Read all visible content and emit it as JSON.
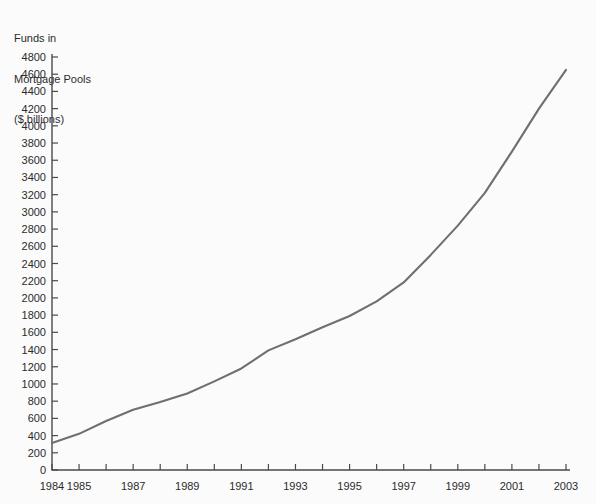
{
  "title": {
    "line1": "Funds in",
    "line2": "Mortgage Pools",
    "line3": "($ billions)"
  },
  "colors": {
    "line": "#6f6f6f",
    "axis": "#4a4a4a",
    "text": "#2b2b2b",
    "background": "#fbfbfb"
  },
  "chart_data": {
    "type": "line",
    "title": "Funds in Mortgage Pools ($ billions)",
    "xlabel": "",
    "ylabel": "Funds in Mortgage Pools ($ billions)",
    "ylim": [
      0,
      4800
    ],
    "xlim": [
      1984,
      2003
    ],
    "grid": false,
    "legend": "none",
    "ytick_labels": [
      "0",
      "200",
      "400",
      "600",
      "800",
      "1000",
      "1200",
      "1400",
      "1600",
      "1800",
      "2000",
      "2200",
      "2400",
      "2600",
      "2800",
      "3000",
      "3200",
      "3400",
      "3600",
      "3800",
      "4000",
      "4200",
      "4400",
      "4600",
      "4800"
    ],
    "ytick_values": [
      0,
      200,
      400,
      600,
      800,
      1000,
      1200,
      1400,
      1600,
      1800,
      2000,
      2200,
      2400,
      2600,
      2800,
      3000,
      3200,
      3400,
      3600,
      3800,
      4000,
      4200,
      4400,
      4600,
      4800
    ],
    "xtick_labels": [
      "1984",
      "1985",
      "1987",
      "1989",
      "1991",
      "1993",
      "1995",
      "1997",
      "1999",
      "2001",
      "2003"
    ],
    "xtick_values": [
      1984,
      1985,
      1987,
      1989,
      1991,
      1993,
      1995,
      1997,
      1999,
      2001,
      2003
    ],
    "x": [
      1984,
      1985,
      1986,
      1987,
      1988,
      1989,
      1990,
      1991,
      1992,
      1993,
      1994,
      1995,
      1996,
      1997,
      1998,
      1999,
      2000,
      2001,
      2002,
      2003
    ],
    "values": [
      315,
      420,
      570,
      700,
      790,
      890,
      1030,
      1180,
      1390,
      1520,
      1660,
      1790,
      1960,
      2180,
      2500,
      2840,
      3220,
      3700,
      4200,
      4650
    ],
    "series": [
      {
        "name": "Funds in Mortgage Pools",
        "values": [
          315,
          420,
          570,
          700,
          790,
          890,
          1030,
          1180,
          1390,
          1520,
          1660,
          1790,
          1960,
          2180,
          2500,
          2840,
          3220,
          3700,
          4200,
          4650
        ]
      }
    ]
  },
  "geometry": {
    "plot_left": 52,
    "plot_right": 566,
    "plot_bottom": 470,
    "plot_top": 57
  }
}
